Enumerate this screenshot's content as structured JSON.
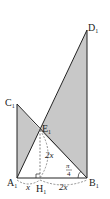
{
  "diagram": {
    "points": {
      "A": {
        "label": "A",
        "sub": "1"
      },
      "B": {
        "label": "B",
        "sub": "1"
      },
      "C": {
        "label": "C",
        "sub": "1"
      },
      "D": {
        "label": "D",
        "sub": "1"
      },
      "E": {
        "label": "E",
        "sub": "1"
      },
      "H": {
        "label": "H",
        "sub": "1"
      }
    },
    "annotations": {
      "EH_length": "2x",
      "AH_length": "x",
      "HB_length": "2x",
      "angle_num": "π",
      "angle_den": "4"
    },
    "colors": {
      "fill": "#c8c8c8",
      "stroke": "#222222",
      "dashed": "#666666"
    }
  }
}
